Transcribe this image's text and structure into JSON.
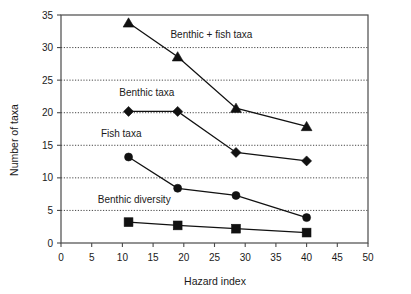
{
  "chart_data": {
    "type": "line",
    "title": "",
    "xlabel": "Hazard index",
    "ylabel": "Number of taxa",
    "xlim": [
      0,
      50
    ],
    "ylim": [
      0,
      35
    ],
    "xticks": [
      0,
      5,
      10,
      15,
      20,
      25,
      30,
      35,
      40,
      45,
      50
    ],
    "yticks": [
      0,
      5,
      10,
      15,
      20,
      25,
      30,
      35
    ],
    "xtick_labels": [
      "0",
      "5",
      "10",
      "15",
      "20",
      "25",
      "30",
      "35",
      "40",
      "45",
      "50"
    ],
    "ytick_labels": [
      "0",
      "5",
      "10",
      "15",
      "20",
      "25",
      "30",
      "35"
    ],
    "grid": "horizontal-dotted",
    "gridlines_y": [
      5,
      10,
      15,
      20,
      25,
      30
    ],
    "legend": "inline-annotations",
    "x": [
      11,
      19,
      28.5,
      40
    ],
    "series": [
      {
        "name": "Benthic + fish taxa",
        "marker": "triangle",
        "color": "#111111",
        "values": [
          33.8,
          28.6,
          20.7,
          17.9
        ],
        "label_x": 24.5,
        "label_y": 31.5,
        "label_anchor": "middle"
      },
      {
        "name": "Benthic taxa",
        "marker": "diamond",
        "color": "#111111",
        "values": [
          20.2,
          20.2,
          13.9,
          12.6
        ],
        "label_x": 9.5,
        "label_y": 22.6,
        "label_anchor": "start"
      },
      {
        "name": "Fish taxa",
        "marker": "circle",
        "color": "#111111",
        "values": [
          13.2,
          8.4,
          7.3,
          3.9
        ],
        "label_x": 6.5,
        "label_y": 16.2,
        "label_anchor": "start"
      },
      {
        "name": "Benthic diversity",
        "marker": "square",
        "color": "#111111",
        "values": [
          3.2,
          2.7,
          2.2,
          1.6
        ],
        "label_x": 6.0,
        "label_y": 6.1,
        "label_anchor": "start"
      }
    ]
  }
}
